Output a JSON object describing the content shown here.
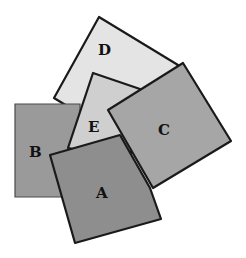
{
  "diagram": {
    "stacking_order_bottom_to_top": [
      "D",
      "B",
      "E",
      "C",
      "A"
    ],
    "squares": [
      {
        "label": "D",
        "fill": "#e4e4e4",
        "points": "99,17 178,65 133,146 54,98",
        "label_x": 104,
        "label_y": 50
      },
      {
        "label": "B",
        "fill": "#9a9a9a",
        "points": "15,104 80,104 80,197 15,197",
        "label_x": 36,
        "label_y": 153
      },
      {
        "label": "E",
        "fill": "#cfcfcf",
        "points": "93,73 140,89 130,160 68,148",
        "label_x": 93,
        "label_y": 127
      },
      {
        "label": "C",
        "fill": "#a6a6a6",
        "points": "183,63 231,141 153,188 108,110",
        "label_x": 167,
        "label_y": 130
      },
      {
        "label": "A",
        "fill": "#8e8e8e",
        "points": "50,155 120,135 150,188 161,219 75,243",
        "label_x": 104,
        "label_y": 195
      }
    ]
  }
}
